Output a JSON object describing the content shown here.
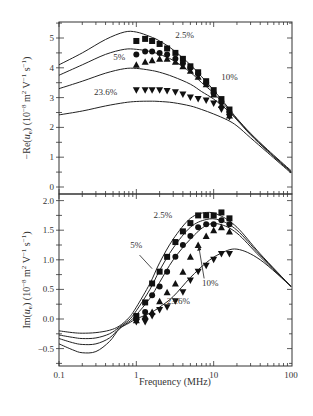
{
  "chart_data": [
    {
      "type": "line",
      "panel": "top",
      "title": "",
      "xlabel": "Frequency (MHz)",
      "ylabel": "−Re(u_e) (10^−8 m² V^−1 s^−1)",
      "xscale": "log",
      "xlim": [
        0.1,
        100
      ],
      "ylim": [
        -0.25,
        5.55
      ],
      "yticks": [
        0,
        1,
        2,
        3,
        4,
        5
      ],
      "ytick_labels": [
        "0",
        "1",
        "2",
        "3",
        "4",
        "5"
      ],
      "grid": false,
      "annotations": [
        {
          "text": "2.5%",
          "x": 4.2,
          "y": 5.0
        },
        {
          "text": "5%",
          "x": 0.6,
          "y": 4.25
        },
        {
          "text": "10%",
          "x": 16,
          "y": 3.6
        },
        {
          "text": "23.6%",
          "x": 0.4,
          "y": 3.1
        }
      ],
      "curves": [
        {
          "name": "2.5% model",
          "x": [
            0.1,
            0.2,
            0.4,
            0.7,
            1,
            1.5,
            2,
            3,
            5,
            7,
            10,
            15,
            20,
            30,
            50,
            100
          ],
          "values": [
            4.1,
            4.5,
            4.95,
            5.2,
            5.2,
            5.05,
            4.9,
            4.6,
            4.1,
            3.7,
            3.25,
            2.7,
            2.3,
            1.8,
            1.25,
            0.55
          ]
        },
        {
          "name": "5% model",
          "x": [
            0.1,
            0.2,
            0.4,
            0.7,
            1,
            1.5,
            2,
            3,
            5,
            7,
            10,
            15,
            20,
            30,
            50,
            100
          ],
          "values": [
            3.75,
            4.1,
            4.45,
            4.62,
            4.62,
            4.55,
            4.45,
            4.25,
            3.85,
            3.5,
            3.15,
            2.65,
            2.28,
            1.78,
            1.22,
            0.52
          ]
        },
        {
          "name": "10% model",
          "x": [
            0.1,
            0.2,
            0.4,
            0.7,
            1,
            1.5,
            2,
            3,
            5,
            7,
            10,
            15,
            20,
            30,
            50,
            100
          ],
          "values": [
            3.3,
            3.55,
            3.82,
            3.97,
            3.98,
            3.92,
            3.85,
            3.7,
            3.45,
            3.2,
            2.95,
            2.58,
            2.25,
            1.75,
            1.2,
            0.5
          ]
        },
        {
          "name": "23.6% model",
          "x": [
            0.1,
            0.2,
            0.4,
            0.7,
            1,
            1.5,
            2,
            3,
            5,
            7,
            10,
            15,
            20,
            30,
            50,
            100
          ],
          "values": [
            2.42,
            2.55,
            2.72,
            2.83,
            2.87,
            2.88,
            2.87,
            2.83,
            2.72,
            2.6,
            2.45,
            2.25,
            2.05,
            1.65,
            1.15,
            0.47
          ]
        }
      ],
      "series": [
        {
          "name": "2.5%",
          "marker": "square",
          "x": [
            1,
            1.3,
            1.6,
            2,
            2.5,
            3.2,
            4,
            5,
            6.3,
            8,
            10,
            12.6,
            16
          ],
          "values": [
            4.9,
            4.97,
            4.9,
            4.8,
            4.65,
            4.5,
            4.3,
            4.05,
            3.85,
            3.55,
            3.25,
            2.95,
            2.6
          ]
        },
        {
          "name": "5%",
          "marker": "circle",
          "x": [
            1,
            1.3,
            1.6,
            2,
            2.5,
            3.2,
            4,
            5,
            6.3,
            8,
            10,
            12.6,
            16
          ],
          "values": [
            4.45,
            4.55,
            4.55,
            4.5,
            4.45,
            4.3,
            4.15,
            4.0,
            3.8,
            3.5,
            3.15,
            2.85,
            2.5
          ]
        },
        {
          "name": "10%",
          "marker": "triangle-up",
          "x": [
            1,
            1.3,
            1.6,
            2,
            2.5,
            3.2,
            4,
            5,
            6.3,
            8,
            10,
            12.6,
            16
          ],
          "values": [
            4.1,
            4.2,
            4.25,
            4.3,
            4.3,
            4.2,
            4.05,
            3.9,
            3.7,
            3.45,
            3.1,
            2.75,
            2.4
          ]
        },
        {
          "name": "23.6%",
          "marker": "triangle-down",
          "x": [
            1,
            1.3,
            1.6,
            2,
            2.5,
            3.2,
            4,
            5,
            6.3,
            8,
            10,
            12.6,
            16
          ],
          "values": [
            3.25,
            3.25,
            3.25,
            3.25,
            3.22,
            3.18,
            3.1,
            3.0,
            2.95,
            2.9,
            2.8,
            2.6,
            2.35
          ]
        }
      ]
    },
    {
      "type": "line",
      "panel": "bottom",
      "title": "",
      "xlabel": "Frequency (MHz)",
      "ylabel": "Im(u_e) (10^−8 m² V^−1 s^−1)",
      "xscale": "log",
      "xlim": [
        0.1,
        100
      ],
      "xticks": [
        0.1,
        1,
        10,
        100
      ],
      "xtick_labels": [
        "0.1",
        "1",
        "10",
        "100"
      ],
      "ylim": [
        -0.8,
        2.1
      ],
      "yticks": [
        -0.5,
        0.0,
        0.5,
        1.0,
        1.5,
        2.0
      ],
      "ytick_labels": [
        "−0.5",
        "0.0",
        "0.5",
        "1.0",
        "1.5",
        "2.0"
      ],
      "grid": false,
      "annotations": [
        {
          "text": "2.5%",
          "x": 2.2,
          "y": 1.7
        },
        {
          "text": "5%",
          "x": 1.0,
          "y": 1.2
        },
        {
          "text": "10%",
          "x": 9.0,
          "y": 0.55,
          "arrow_to": {
            "x": 6.5,
            "y": 1.25
          }
        },
        {
          "text": "23.6%",
          "x": 3.5,
          "y": 0.25
        }
      ],
      "curves": [
        {
          "name": "2.5% model",
          "x": [
            0.1,
            0.15,
            0.2,
            0.3,
            0.45,
            0.6,
            0.8,
            1,
            1.5,
            2,
            3,
            5,
            8,
            12,
            20,
            40,
            100
          ],
          "values": [
            -0.2,
            -0.23,
            -0.24,
            -0.23,
            -0.19,
            -0.12,
            0.02,
            0.2,
            0.6,
            0.95,
            1.35,
            1.7,
            1.8,
            1.75,
            1.55,
            1.1,
            0.55
          ]
        },
        {
          "name": "5% model",
          "x": [
            0.1,
            0.15,
            0.2,
            0.3,
            0.45,
            0.6,
            0.8,
            1,
            1.5,
            2,
            3,
            5,
            8,
            12,
            20,
            40,
            100
          ],
          "values": [
            -0.27,
            -0.31,
            -0.33,
            -0.32,
            -0.25,
            -0.14,
            -0.02,
            0.14,
            0.5,
            0.82,
            1.2,
            1.55,
            1.68,
            1.67,
            1.5,
            1.08,
            0.55
          ]
        },
        {
          "name": "10% model",
          "x": [
            0.1,
            0.15,
            0.2,
            0.3,
            0.45,
            0.6,
            0.8,
            1,
            1.5,
            2,
            3,
            5,
            8,
            12,
            20,
            40,
            100
          ],
          "values": [
            -0.33,
            -0.4,
            -0.43,
            -0.42,
            -0.32,
            -0.16,
            -0.05,
            0.07,
            0.35,
            0.62,
            1.0,
            1.35,
            1.58,
            1.6,
            1.45,
            1.05,
            0.55
          ]
        },
        {
          "name": "23.6% model",
          "x": [
            0.1,
            0.15,
            0.2,
            0.3,
            0.45,
            0.6,
            0.8,
            1,
            1.5,
            2,
            3,
            5,
            8,
            12,
            20,
            40,
            100
          ],
          "values": [
            -0.42,
            -0.52,
            -0.57,
            -0.55,
            -0.38,
            -0.17,
            -0.07,
            0.0,
            0.1,
            0.2,
            0.38,
            0.7,
            0.95,
            1.1,
            1.18,
            1.0,
            0.55
          ]
        }
      ],
      "series": [
        {
          "name": "2.5%",
          "marker": "square",
          "x": [
            1,
            1.3,
            1.6,
            2,
            2.5,
            3.2,
            4,
            5,
            6.3,
            8,
            10,
            12.6,
            16
          ],
          "values": [
            0.05,
            0.28,
            0.6,
            0.8,
            1.05,
            1.3,
            1.48,
            1.62,
            1.75,
            1.75,
            1.75,
            1.8,
            1.7
          ]
        },
        {
          "name": "5%",
          "marker": "circle",
          "x": [
            1,
            1.3,
            1.6,
            2,
            2.5,
            3.2,
            4,
            5,
            6.3,
            8,
            10,
            12.6,
            16
          ],
          "values": [
            0.0,
            0.12,
            0.4,
            0.55,
            0.8,
            1.05,
            1.25,
            1.4,
            1.55,
            1.6,
            1.6,
            1.67,
            1.6
          ]
        },
        {
          "name": "10%",
          "marker": "triangle-up",
          "x": [
            1,
            1.3,
            1.6,
            2,
            2.5,
            3.2,
            4,
            5,
            6.3,
            8,
            10,
            12.6,
            16
          ],
          "values": [
            -0.02,
            0.05,
            0.12,
            0.3,
            0.45,
            0.6,
            0.8,
            1.05,
            1.25,
            1.4,
            1.5,
            1.55,
            1.48
          ]
        },
        {
          "name": "23.6%",
          "marker": "triangle-down",
          "x": [
            1,
            1.3,
            1.6,
            2,
            2.5,
            3.2,
            4,
            5,
            6.3,
            8,
            10,
            12.6,
            16
          ],
          "values": [
            -0.05,
            -0.05,
            0.05,
            0.15,
            0.2,
            0.3,
            0.45,
            0.65,
            0.8,
            0.9,
            1.0,
            1.1,
            1.1
          ]
        }
      ]
    }
  ],
  "axes": {
    "x_title": "Frequency (MHz)",
    "top_y_title": "−Re(u",
    "top_y_sub": "e",
    "top_y_rest": ") (10",
    "top_y_exp": "−8",
    "top_y_units": " m",
    "bottom_y_title": "Im(u"
  }
}
